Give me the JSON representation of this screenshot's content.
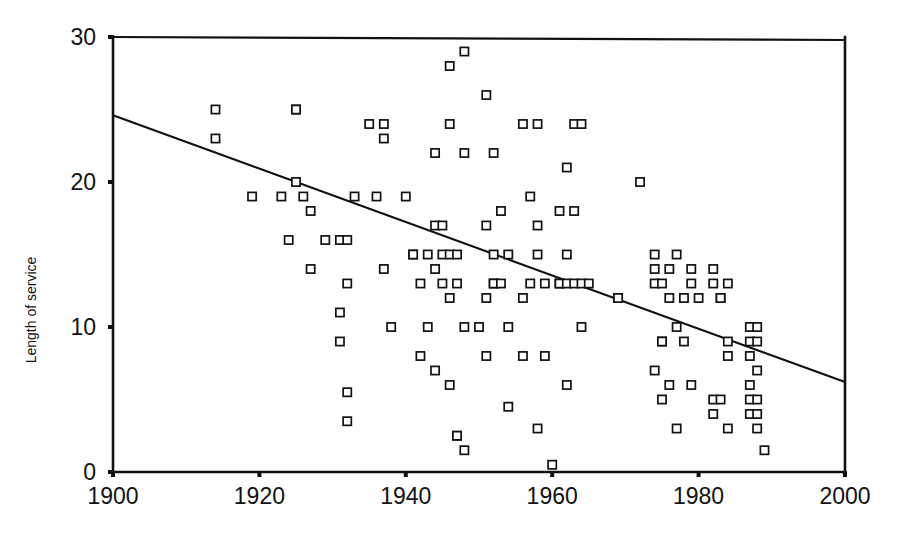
{
  "chart_data": {
    "type": "scatter",
    "title": "",
    "subtitle": "",
    "xlabel": "",
    "ylabel": "Length of service",
    "xlim": [
      1900,
      2000
    ],
    "ylim": [
      0,
      30
    ],
    "grid": false,
    "legend": null,
    "x_ticks": [
      1900,
      1920,
      1940,
      1960,
      1980,
      2000
    ],
    "x_tick_labels": [
      "1900",
      "1920",
      "1940",
      "1960",
      "1980",
      "2000"
    ],
    "y_ticks": [
      0,
      10,
      20,
      30
    ],
    "y_tick_labels": [
      "0",
      "10",
      "20",
      "30"
    ],
    "marker": "open-square",
    "marker_color": "#111111",
    "marker_fill": "#ffffff",
    "series": [
      {
        "name": "Length of service",
        "points": [
          [
            1914,
            25
          ],
          [
            1914,
            23
          ],
          [
            1919,
            19
          ],
          [
            1923,
            19
          ],
          [
            1924,
            16
          ],
          [
            1925,
            25
          ],
          [
            1925,
            25
          ],
          [
            1925,
            20
          ],
          [
            1926,
            19
          ],
          [
            1927,
            18
          ],
          [
            1927,
            14
          ],
          [
            1929,
            16
          ],
          [
            1931,
            16
          ],
          [
            1931,
            11
          ],
          [
            1931,
            9
          ],
          [
            1932,
            16
          ],
          [
            1932,
            13
          ],
          [
            1932,
            5.5
          ],
          [
            1932,
            3.5
          ],
          [
            1933,
            19
          ],
          [
            1935,
            24
          ],
          [
            1936,
            19
          ],
          [
            1937,
            24
          ],
          [
            1937,
            23
          ],
          [
            1937,
            14
          ],
          [
            1938,
            10
          ],
          [
            1940,
            19
          ],
          [
            1941,
            15
          ],
          [
            1941,
            15
          ],
          [
            1942,
            13
          ],
          [
            1942,
            8
          ],
          [
            1943,
            15
          ],
          [
            1943,
            10
          ],
          [
            1944,
            22
          ],
          [
            1944,
            17
          ],
          [
            1944,
            14
          ],
          [
            1944,
            7
          ],
          [
            1945,
            17
          ],
          [
            1945,
            15
          ],
          [
            1945,
            13
          ],
          [
            1946,
            28
          ],
          [
            1946,
            24
          ],
          [
            1946,
            15
          ],
          [
            1946,
            12
          ],
          [
            1946,
            6
          ],
          [
            1947,
            15
          ],
          [
            1947,
            13
          ],
          [
            1947,
            2.5
          ],
          [
            1947,
            2.5
          ],
          [
            1948,
            29
          ],
          [
            1948,
            22
          ],
          [
            1948,
            10
          ],
          [
            1948,
            1.5
          ],
          [
            1950,
            10
          ],
          [
            1951,
            26
          ],
          [
            1951,
            17
          ],
          [
            1951,
            12
          ],
          [
            1951,
            8
          ],
          [
            1952,
            22
          ],
          [
            1952,
            15
          ],
          [
            1952,
            13
          ],
          [
            1952,
            13
          ],
          [
            1953,
            18
          ],
          [
            1953,
            13
          ],
          [
            1954,
            15
          ],
          [
            1954,
            10
          ],
          [
            1954,
            4.5
          ],
          [
            1956,
            24
          ],
          [
            1956,
            12
          ],
          [
            1956,
            8
          ],
          [
            1957,
            19
          ],
          [
            1957,
            13
          ],
          [
            1958,
            24
          ],
          [
            1958,
            17
          ],
          [
            1958,
            15
          ],
          [
            1958,
            3
          ],
          [
            1959,
            13
          ],
          [
            1959,
            8
          ],
          [
            1960,
            0.5
          ],
          [
            1961,
            18
          ],
          [
            1961,
            13
          ],
          [
            1961,
            13
          ],
          [
            1962,
            21
          ],
          [
            1962,
            15
          ],
          [
            1962,
            13
          ],
          [
            1962,
            6
          ],
          [
            1963,
            24
          ],
          [
            1963,
            18
          ],
          [
            1963,
            13
          ],
          [
            1964,
            24
          ],
          [
            1964,
            13
          ],
          [
            1964,
            10
          ],
          [
            1965,
            13
          ],
          [
            1969,
            12
          ],
          [
            1969,
            12
          ],
          [
            1972,
            20
          ],
          [
            1974,
            15
          ],
          [
            1974,
            14
          ],
          [
            1974,
            13
          ],
          [
            1974,
            7
          ],
          [
            1975,
            13
          ],
          [
            1975,
            9
          ],
          [
            1975,
            9
          ],
          [
            1975,
            5
          ],
          [
            1976,
            14
          ],
          [
            1976,
            12
          ],
          [
            1976,
            6
          ],
          [
            1977,
            15
          ],
          [
            1977,
            10
          ],
          [
            1977,
            3
          ],
          [
            1978,
            12
          ],
          [
            1978,
            9
          ],
          [
            1979,
            14
          ],
          [
            1979,
            13
          ],
          [
            1979,
            6
          ],
          [
            1980,
            12
          ],
          [
            1982,
            14
          ],
          [
            1982,
            13
          ],
          [
            1982,
            5
          ],
          [
            1982,
            4
          ],
          [
            1983,
            12
          ],
          [
            1983,
            12
          ],
          [
            1983,
            5
          ],
          [
            1984,
            13
          ],
          [
            1984,
            9
          ],
          [
            1984,
            8
          ],
          [
            1984,
            3
          ],
          [
            1987,
            10
          ],
          [
            1987,
            9
          ],
          [
            1987,
            8
          ],
          [
            1987,
            6
          ],
          [
            1987,
            5
          ],
          [
            1987,
            4
          ],
          [
            1988,
            10
          ],
          [
            1988,
            9
          ],
          [
            1988,
            7
          ],
          [
            1988,
            5
          ],
          [
            1988,
            4
          ],
          [
            1988,
            3
          ],
          [
            1989,
            1.5
          ]
        ]
      }
    ],
    "trend_line": {
      "type": "linear-fit",
      "x_start": 1900,
      "y_start": 24.6,
      "x_end": 2000,
      "y_end": 6.2
    }
  }
}
